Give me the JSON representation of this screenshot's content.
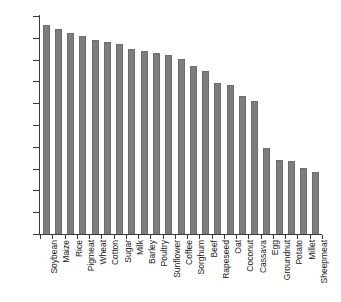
{
  "chart_data": {
    "type": "bar",
    "title": "",
    "subtitle": "",
    "xlabel": "",
    "ylabel": "",
    "ylim": [
      0,
      100
    ],
    "yticks": [
      0,
      10,
      20,
      30,
      40,
      50,
      60,
      70,
      80,
      90,
      100
    ],
    "grid": false,
    "legend": false,
    "bar_color": "#7d7d7d",
    "axis_color": "#3a3a3a",
    "orientation": "vertical",
    "categories": [
      "Soybean",
      "Maize",
      "Rice",
      "Pigmeat",
      "Wheat",
      "Cotton",
      "Sugar",
      "Milk",
      "Barley",
      "Poultry",
      "Sunflower",
      "Coffee",
      "Sorghum",
      "Beef",
      "Rapeseed",
      "Oat",
      "Coconut",
      "Cassava",
      "Egg",
      "Groundnut",
      "Potato",
      "Millet",
      "Sheepmeat"
    ],
    "values": [
      96,
      94,
      92,
      91,
      89,
      88,
      87,
      85,
      84,
      83,
      82,
      80.5,
      77,
      75,
      69.5,
      68.5,
      63.5,
      61,
      39.5,
      34,
      33.5,
      30.5,
      28.5
    ]
  }
}
